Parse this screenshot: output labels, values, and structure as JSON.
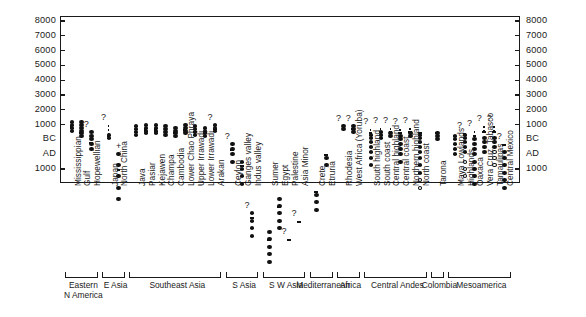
{
  "chart_data": {
    "type": "bar",
    "title": "",
    "subtitle": "",
    "xlabel": "",
    "ylabel": "",
    "orientation": "vertical",
    "grid": false,
    "legend": null,
    "axis": {
      "left_ticks": [
        "8000",
        "7000",
        "6000",
        "5000",
        "4000",
        "3000",
        "2000",
        "1000",
        "BC",
        "AD",
        "1000"
      ],
      "right_ticks": [
        "8000",
        "7000",
        "6000",
        "5000",
        "4000",
        "3000",
        "2000",
        "1000",
        "BC",
        "AD",
        "1000"
      ],
      "scale_note": "Years BC above the BC/AD break, years AD below",
      "ylim": [
        -1200,
        8000
      ],
      "tick_values": [
        8000,
        7000,
        6000,
        5000,
        4000,
        3000,
        2000,
        1000,
        0,
        -600,
        -1000
      ]
    },
    "groups": [
      {
        "label": "Eastern\nN America",
        "start": 0,
        "count": 3
      },
      {
        "label": "E Asia",
        "start": 3,
        "count": 2
      },
      {
        "label": "Southeast Asia",
        "start": 5,
        "count": 9
      },
      {
        "label": "S Asia",
        "start": 14,
        "count": 3
      },
      {
        "label": "S W Asia",
        "start": 17,
        "count": 4
      },
      {
        "label": "Mediterranean",
        "start": 21,
        "count": 2
      },
      {
        "label": "Africa",
        "start": 23,
        "count": 2
      },
      {
        "label": "Central Andes",
        "start": 25,
        "count": 6
      },
      {
        "label": "Colombia",
        "start": 31,
        "count": 1
      },
      {
        "label": "Mesoamerica",
        "start": 32,
        "count": 6
      }
    ],
    "categories": [
      "Mississippian",
      "Gulf",
      "Hopewellian",
      "Japan",
      "North China",
      "Java",
      "Pasiar",
      "Kejawen",
      "Champa",
      "Cambodia",
      "Lower Chao Phraya",
      "Upper Irrawadi",
      "Lower Irrawadi",
      "Arakan",
      "Ceylon",
      "Ganges valley",
      "Indus valley",
      "Sumer",
      "Egypt",
      "Palestine",
      "Asia Minor",
      "Crete",
      "Etruria",
      "Rhodesia",
      "West Africa (Yoruba)",
      "South highland",
      "South coast",
      "Central highland",
      "Central coast",
      "Northern highland",
      "North coast",
      "Tarona",
      "Maya Lowlands",
      "Highlands",
      "Oaxaca",
      "Vera Cruz, Tabasco",
      "Tamaulipas",
      "Central Mexico"
    ],
    "series": [
      {
        "name": "Mississippian",
        "bar_top": 900,
        "bar_bottom": 1400,
        "dots": [
          600,
          800,
          1000,
          1200
        ],
        "open_dots": [],
        "dash_top": null,
        "question": null
      },
      {
        "name": "Gulf",
        "bar_top": 500,
        "bar_bottom": 1400,
        "dots": [
          200,
          400,
          600,
          800,
          1000,
          1200
        ],
        "open_dots": [],
        "dash_top": null,
        "question": null
      },
      {
        "name": "Hopewellian",
        "bar_top": -100,
        "bar_bottom": 1000,
        "dots": [
          -400,
          -200,
          0,
          200,
          500
        ],
        "open_dots": [],
        "dash_top": null,
        "question": "?"
      },
      {
        "name": "Japan",
        "bar_top": 300,
        "bar_bottom": 1500,
        "dots": [
          100,
          300
        ],
        "open_dots": [],
        "dash_top": 1000,
        "question": "?"
      },
      {
        "name": "North China",
        "bar_top": -1000,
        "bar_bottom": 1400,
        "dots": [
          -1800,
          -1500,
          -1200,
          -900,
          -600
        ],
        "open_dots": [],
        "dash_top": null,
        "question": "+"
      },
      {
        "name": "Java",
        "bar_top": 600,
        "bar_bottom": 1500,
        "dots": [
          300,
          500,
          700,
          900
        ],
        "open_dots": [],
        "dash_top": null,
        "question": null
      },
      {
        "name": "Pasiar",
        "bar_top": 700,
        "bar_bottom": 1500,
        "dots": [
          400,
          600,
          800,
          1000
        ],
        "open_dots": [],
        "dash_top": null,
        "question": null
      },
      {
        "name": "Kejawen",
        "bar_top": 700,
        "bar_bottom": 1500,
        "dots": [
          400,
          600,
          800,
          1000
        ],
        "open_dots": [],
        "dash_top": null,
        "question": null
      },
      {
        "name": "Champa",
        "bar_top": 600,
        "bar_bottom": 1500,
        "dots": [
          300,
          500,
          700,
          900
        ],
        "open_dots": [],
        "dash_top": null,
        "question": null
      },
      {
        "name": "Cambodia",
        "bar_top": 500,
        "bar_bottom": 1500,
        "dots": [
          200,
          400,
          600,
          800
        ],
        "open_dots": [],
        "dash_top": null,
        "question": null
      },
      {
        "name": "Lower Chao Phraya",
        "bar_top": 700,
        "bar_bottom": 1500,
        "dots": [
          400,
          600,
          800,
          1000
        ],
        "open_dots": [],
        "dash_top": null,
        "question": null
      },
      {
        "name": "Upper Irrawadi",
        "bar_top": 600,
        "bar_bottom": 1500,
        "dots": [
          300,
          500,
          700,
          900
        ],
        "open_dots": [],
        "dash_top": null,
        "question": null
      },
      {
        "name": "Lower Irrawadi",
        "bar_top": 500,
        "bar_bottom": 1500,
        "dots": [
          200,
          400,
          600,
          800
        ],
        "open_dots": [],
        "dash_top": null,
        "question": null
      },
      {
        "name": "Arakan",
        "bar_top": 800,
        "bar_bottom": 1500,
        "dots": [
          600,
          800,
          1000
        ],
        "open_dots": [],
        "dash_top": null,
        "question": "?"
      },
      {
        "name": "Ceylon",
        "bar_top": -400,
        "bar_bottom": 1400,
        "dots": [
          -800,
          -600,
          -400,
          -200
        ],
        "open_dots": [],
        "dash_top": null,
        "question": "?"
      },
      {
        "name": "Ganges valley",
        "bar_top": -900,
        "bar_bottom": 1400,
        "dots": [
          -1400,
          -1200,
          -1000,
          -800
        ],
        "open_dots": [],
        "dash_top": null,
        "question": null
      },
      {
        "name": "Indus valley",
        "bar_top": -2300,
        "bar_bottom": 1400,
        "dots": [
          -2800,
          -2600,
          -2400,
          -2200
        ],
        "open_dots": [],
        "dash_top": null,
        "question": "?"
      },
      {
        "name": "Sumer",
        "bar_top": -2900,
        "bar_bottom": 1400,
        "dots": [
          -3500,
          -3300,
          -3100,
          -2900,
          -2700
        ],
        "open_dots": [],
        "dash_top": null,
        "question": null
      },
      {
        "name": "Egypt",
        "bar_top": -2000,
        "bar_bottom": 1400,
        "dots": [
          -2600,
          -2400,
          -2200,
          -2000,
          -1800
        ],
        "open_dots": [],
        "dash_top": null,
        "question": null
      },
      {
        "name": "Palestine",
        "bar_top": -2900,
        "bar_bottom": 1400,
        "dots": [
          -7400,
          -7200,
          -7000
        ],
        "open_dots": [],
        "dash_top": -6800,
        "question": "?"
      },
      {
        "name": "Asia Minor",
        "bar_top": -2400,
        "bar_bottom": 1400,
        "dots": [
          -6300,
          -6100,
          -5900,
          -5700
        ],
        "open_dots": [],
        "dash_top": -5500,
        "question": "?"
      },
      {
        "name": "Crete",
        "bar_top": -1600,
        "bar_bottom": 1100,
        "dots": [
          -2100,
          -1900,
          -1700
        ],
        "open_dots": [],
        "dash_top": null,
        "question": null
      },
      {
        "name": "Etruria",
        "bar_top": -600,
        "bar_bottom": 1000,
        "dots": [
          -900,
          -700
        ],
        "open_dots": [],
        "dash_top": null,
        "question": null
      },
      {
        "name": "Rhodesia",
        "bar_top": 900,
        "bar_bottom": 1500,
        "dots": [
          700,
          900
        ],
        "open_dots": [],
        "dash_top": null,
        "question": "?"
      },
      {
        "name": "West Africa (Yoruba)",
        "bar_top": 800,
        "bar_bottom": 1500,
        "dots": [
          500,
          700,
          900
        ],
        "open_dots": [],
        "dash_top": null,
        "question": "?"
      },
      {
        "name": "South highland",
        "bar_top": 500,
        "bar_bottom": 1500,
        "dots": [
          -900,
          -700,
          -500,
          -300,
          -100,
          100,
          300
        ],
        "open_dots": [],
        "dash_top": 700,
        "question": "?"
      },
      {
        "name": "South coast",
        "bar_top": 600,
        "bar_bottom": 1500,
        "dots": [
          100,
          300,
          500
        ],
        "open_dots": [],
        "dash_top": 800,
        "question": "?"
      },
      {
        "name": "Central highland",
        "bar_top": 600,
        "bar_bottom": 1500,
        "dots": [
          200,
          400
        ],
        "open_dots": [],
        "dash_top": 800,
        "question": "?"
      },
      {
        "name": "Central coast",
        "bar_top": 500,
        "bar_bottom": 1500,
        "dots": [
          -800,
          -600,
          -400,
          -200,
          0,
          200
        ],
        "open_dots": [],
        "dash_top": 700,
        "question": "?"
      },
      {
        "name": "Northern highland",
        "bar_top": 600,
        "bar_bottom": 1500,
        "dots": [
          200,
          400
        ],
        "open_dots": [],
        "dash_top": 800,
        "question": "?"
      },
      {
        "name": "North coast",
        "bar_top": 500,
        "bar_bottom": 1500,
        "dots": [
          -1100,
          -900,
          -700,
          -500,
          -300,
          -100,
          100,
          300
        ],
        "open_dots": [
          -1500,
          -1300
        ],
        "dash_top": null,
        "question": null
      },
      {
        "name": "Tarona",
        "bar_top": 500,
        "bar_bottom": 1500,
        "dots": [
          0,
          200,
          400
        ],
        "open_dots": [],
        "dash_top": null,
        "question": null
      },
      {
        "name": "Maya Lowlands",
        "bar_top": 300,
        "bar_bottom": 1500,
        "dots": [
          -600,
          -400,
          -200,
          0,
          200
        ],
        "open_dots": [],
        "dash_top": null,
        "question": null
      },
      {
        "name": "Highlands",
        "bar_top": 400,
        "bar_bottom": 1500,
        "dots": [
          -500,
          -300,
          -100,
          100,
          300
        ],
        "open_dots": [
          -1200,
          -1000,
          -800
        ],
        "dash_top": null,
        "question": "?"
      },
      {
        "name": "Oaxaca",
        "bar_top": 300,
        "bar_bottom": 1500,
        "dots": [
          -1400,
          -1200,
          -1000,
          -800,
          -600,
          -400,
          -200,
          0
        ],
        "open_dots": [],
        "dash_top": 600,
        "question": "?"
      },
      {
        "name": "Vera Cruz, Tabasco",
        "bar_top": 600,
        "bar_bottom": 1500,
        "dots": [
          -500,
          -300,
          -100,
          100
        ],
        "open_dots": [],
        "dash_top": 900,
        "question": "?"
      },
      {
        "name": "Tamaulipas",
        "bar_top": 600,
        "bar_bottom": 1500,
        "dots": [
          -300,
          -100,
          100
        ],
        "open_dots": [
          -900,
          -700,
          -500
        ],
        "dash_top": 900,
        "question": "?"
      },
      {
        "name": "Central Mexico",
        "bar_top": -200,
        "bar_bottom": 1500,
        "dots": [
          -1500,
          -1300,
          -1100,
          -900,
          -700,
          -500
        ],
        "open_dots": [],
        "dash_top": null,
        "question": "?"
      }
    ]
  }
}
